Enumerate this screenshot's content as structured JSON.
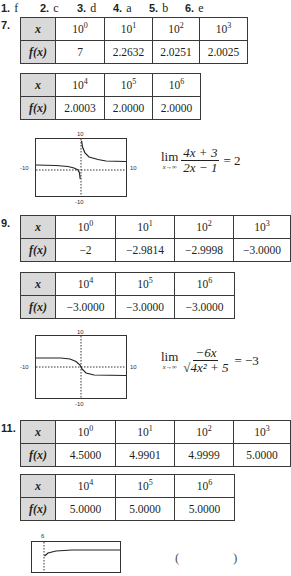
{
  "answers": [
    {
      "num": "1.",
      "value": "f"
    },
    {
      "num": "2.",
      "value": "c"
    },
    {
      "num": "3.",
      "value": "d"
    },
    {
      "num": "4.",
      "value": "a"
    },
    {
      "num": "5.",
      "value": "b"
    },
    {
      "num": "6.",
      "value": "e"
    }
  ],
  "problems": {
    "p7": {
      "num": "7.",
      "x_label": "x",
      "fx_label": "f(x)",
      "table1": {
        "x": [
          "10",
          "10",
          "10",
          "10"
        ],
        "exp": [
          "0",
          "1",
          "2",
          "3"
        ],
        "fx": [
          "7",
          "2.2632",
          "2.0251",
          "2.0025"
        ]
      },
      "table2": {
        "x": [
          "10",
          "10",
          "10"
        ],
        "exp": [
          "4",
          "5",
          "6"
        ],
        "fx": [
          "2.0003",
          "2.0000",
          "2.0000"
        ]
      },
      "graph": {
        "top": "10",
        "bottom": "-10",
        "left": "-10",
        "right": "10"
      },
      "limit": {
        "lim": "lim",
        "sub": "x→∞",
        "numerator": "4x + 3",
        "denominator": "2x − 1",
        "result": "= 2"
      }
    },
    "p9": {
      "num": "9.",
      "x_label": "x",
      "fx_label": "f(x)",
      "table1": {
        "x": [
          "10",
          "10",
          "10",
          "10"
        ],
        "exp": [
          "0",
          "1",
          "2",
          "3"
        ],
        "fx": [
          "−2",
          "−2.9814",
          "−2.9998",
          "−3.0000"
        ]
      },
      "table2": {
        "x": [
          "10",
          "10",
          "10"
        ],
        "exp": [
          "4",
          "5",
          "6"
        ],
        "fx": [
          "−3.0000",
          "−3.0000",
          "−3.0000"
        ]
      },
      "graph": {
        "top": "10",
        "bottom": "-10",
        "left": "-10",
        "right": "10"
      },
      "limit": {
        "lim": "lim",
        "sub": "x→∞",
        "numerator": "−6x",
        "denominator": "√4x² + 5",
        "result": "= −3"
      }
    },
    "p11": {
      "num": "11.",
      "x_label": "x",
      "fx_label": "f(x)",
      "table1": {
        "x": [
          "10",
          "10",
          "10",
          "10"
        ],
        "exp": [
          "0",
          "1",
          "2",
          "3"
        ],
        "fx": [
          "4.5000",
          "4.9901",
          "4.9999",
          "5.0000"
        ]
      },
      "table2": {
        "x": [
          "10",
          "10",
          "10"
        ],
        "exp": [
          "4",
          "5",
          "6"
        ],
        "fx": [
          "5.0000",
          "5.0000",
          "5.0000"
        ]
      },
      "graph": {
        "top": "6"
      }
    }
  }
}
